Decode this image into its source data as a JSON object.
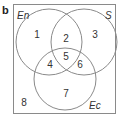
{
  "panel_label": "b",
  "diagram": {
    "type": "venn",
    "colors": {
      "outline": "#8a8a8a",
      "text": "#333333"
    },
    "sets": [
      {
        "id": "En",
        "label": "En"
      },
      {
        "id": "S",
        "label": "S"
      },
      {
        "id": "Ec",
        "label": "Ec"
      }
    ],
    "regions": [
      {
        "label": "1",
        "description": "En only"
      },
      {
        "label": "2",
        "description": "En and S only"
      },
      {
        "label": "3",
        "description": "S only"
      },
      {
        "label": "4",
        "description": "En and Ec only"
      },
      {
        "label": "5",
        "description": "En, S and Ec"
      },
      {
        "label": "6",
        "description": "S and Ec only"
      },
      {
        "label": "7",
        "description": "Ec only"
      },
      {
        "label": "8",
        "description": "none (outside all sets)"
      }
    ]
  }
}
